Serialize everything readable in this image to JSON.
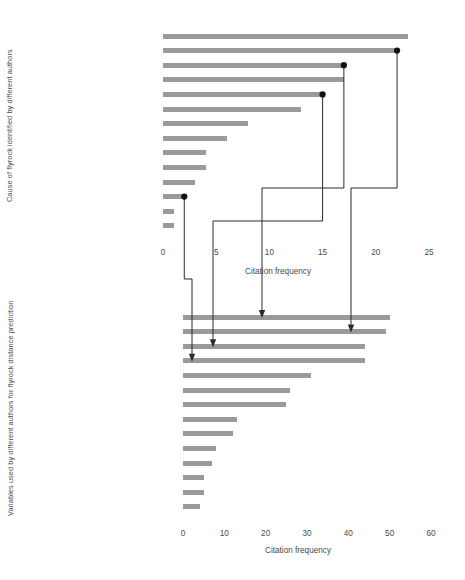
{
  "figure": {
    "background": "#ffffff",
    "bar_color": "#9a9a9a",
    "connector_color": "#2b2b2b",
    "text_color": "#4a4a4a"
  },
  "chart_data": [
    {
      "id": "top",
      "type": "bar",
      "orientation": "horizontal",
      "title": "",
      "xlabel": "Citation frequency",
      "ylabel": "Cause of flyrock identified by different authors",
      "xlim": [
        0,
        25
      ],
      "xticks": [
        0,
        5,
        10,
        15,
        20,
        25
      ],
      "grid": false,
      "legend": "none",
      "categories": [
        "Geological anomalies",
        "Insufficient burden",
        "Insufficient stemming",
        "Inadequate delay",
        "Excessive specific charge",
        "Improper blast layout",
        "Poor quality of stemming",
        "Drilling inaccuracy",
        "Poor confinement",
        "Improper loading of explosives",
        "Misfire",
        "Spacing",
        "Density of explosive",
        "Water-logged blastholes"
      ],
      "values": [
        23,
        22,
        17,
        17,
        15,
        13,
        8,
        6,
        4,
        4,
        3,
        2,
        1,
        1
      ]
    },
    {
      "id": "bottom",
      "type": "bar",
      "orientation": "horizontal",
      "title": "",
      "xlabel": "Citation frequency",
      "ylabel": "Variables used by different authors for flyrock distance prediction",
      "xlim": [
        0,
        60
      ],
      "xticks": [
        0,
        10,
        20,
        30,
        40,
        50,
        60
      ],
      "grid": false,
      "legend": "none",
      "categories": [
        "Stemming",
        "Burden",
        "Specific charge",
        "Spacing",
        "Hole depth",
        "Charge per delay",
        "Blasthole diameter",
        "Density of rock",
        "Linear charge concentration",
        "Rock mass rating",
        "Specific drilling",
        "Velocity of detonation (explosive)",
        "Density of explosive",
        "Drill/blasthole angle"
      ],
      "values": [
        50,
        49,
        44,
        44,
        31,
        26,
        25,
        13,
        12,
        8,
        7,
        5,
        5,
        4
      ]
    }
  ],
  "annotations": {
    "description": "Marker dots on four top-chart bars joined by elbow connectors with arrowheads to four bottom-chart bars",
    "links": [
      {
        "from_category": "Spacing",
        "from_value": 2,
        "to_category": "Spacing"
      },
      {
        "from_category": "Excessive specific charge",
        "from_value": 15,
        "to_category": "Specific charge"
      },
      {
        "from_category": "Insufficient stemming",
        "from_value": 17,
        "to_category": "Stemming"
      },
      {
        "from_category": "Insufficient burden",
        "from_value": 22,
        "to_category": "Burden"
      }
    ]
  }
}
